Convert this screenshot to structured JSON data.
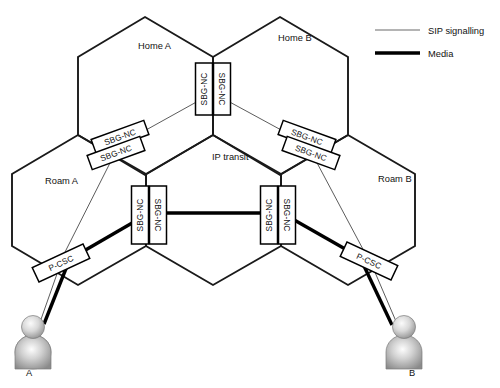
{
  "figure": {
    "background": "#ffffff"
  },
  "colors": {
    "hex_stroke": "#1a1a1a",
    "sip_stroke": "#4a4a4a",
    "media_stroke": "#000000",
    "node_fill": "#ffffff",
    "node_stroke": "#000000",
    "text": "#111111",
    "avatar_light": "#f2f2f2",
    "avatar_mid": "#b8b8b8",
    "avatar_dark": "#8a8a8a"
  },
  "legend": {
    "position": "top-right",
    "items": [
      {
        "label": "SIP signalling",
        "style": "thin-line",
        "color": "#6b6b6b",
        "width": 1.1
      },
      {
        "label": "Media",
        "style": "thick-line",
        "color": "#000000",
        "width": 3.6
      }
    ]
  },
  "areas": [
    {
      "id": "home-a",
      "label": "Home A",
      "label_x": 138,
      "label_y": 49,
      "shape": "hexagon"
    },
    {
      "id": "home-b",
      "label": "Home B",
      "label_x": 278,
      "label_y": 41,
      "shape": "hexagon"
    },
    {
      "id": "ip-transit",
      "label": "IP transit",
      "label_x": 212,
      "label_y": 160,
      "shape": "hexagon"
    },
    {
      "id": "roam-a",
      "label": "Roam A",
      "label_x": 45,
      "label_y": 184,
      "shape": "hexagon"
    },
    {
      "id": "roam-b",
      "label": "Roam B",
      "label_x": 378,
      "label_y": 182,
      "shape": "hexagon"
    }
  ],
  "nodes": [
    {
      "id": "sbg-home-top-left",
      "label": "SBG-NC",
      "orientation": "vertical",
      "rotation": -90,
      "cx": 204,
      "cy": 89,
      "w": 52,
      "h": 17
    },
    {
      "id": "sbg-home-top-right",
      "label": "SBG-NC",
      "orientation": "vertical",
      "rotation": 90,
      "cx": 222,
      "cy": 89,
      "w": 52,
      "h": 17
    },
    {
      "id": "sbg-left-upper",
      "label": "SBG-NC",
      "orientation": "diagonal",
      "rotation": -20,
      "cx": 120,
      "cy": 137,
      "w": 56,
      "h": 15
    },
    {
      "id": "sbg-left-lower",
      "label": "SBG-NC",
      "orientation": "diagonal",
      "rotation": -20,
      "cx": 116,
      "cy": 153,
      "w": 56,
      "h": 15
    },
    {
      "id": "sbg-right-upper",
      "label": "SBG-NC",
      "orientation": "diagonal",
      "rotation": 20,
      "cx": 307,
      "cy": 137,
      "w": 56,
      "h": 15
    },
    {
      "id": "sbg-right-lower",
      "label": "SBG-NC",
      "orientation": "diagonal",
      "rotation": 20,
      "cx": 311,
      "cy": 153,
      "w": 56,
      "h": 15
    },
    {
      "id": "sbg-mid-left-a",
      "label": "SBG-NC",
      "orientation": "vertical",
      "rotation": -90,
      "cx": 140,
      "cy": 215,
      "w": 58,
      "h": 17
    },
    {
      "id": "sbg-mid-left-b",
      "label": "SBG-NC",
      "orientation": "vertical",
      "rotation": 90,
      "cx": 158,
      "cy": 215,
      "w": 58,
      "h": 17
    },
    {
      "id": "sbg-mid-right-a",
      "label": "SBG-NC",
      "orientation": "vertical",
      "rotation": -90,
      "cx": 269,
      "cy": 215,
      "w": 58,
      "h": 17
    },
    {
      "id": "sbg-mid-right-b",
      "label": "SBG-NC",
      "orientation": "vertical",
      "rotation": 90,
      "cx": 287,
      "cy": 215,
      "w": 58,
      "h": 17
    },
    {
      "id": "pcsc-a",
      "label": "P-CSC",
      "orientation": "diagonal",
      "rotation": -25,
      "cx": 61,
      "cy": 263,
      "w": 56,
      "h": 16
    },
    {
      "id": "pcsc-b",
      "label": "P-CSC",
      "orientation": "diagonal",
      "rotation": 25,
      "cx": 369,
      "cy": 261,
      "w": 56,
      "h": 16
    }
  ],
  "endpoints": [
    {
      "id": "user-a",
      "label": "A",
      "x": 33,
      "y": 330,
      "label_x": 26,
      "label_y": 376
    },
    {
      "id": "user-b",
      "label": "B",
      "x": 404,
      "y": 330,
      "label_x": 409,
      "label_y": 376
    }
  ]
}
